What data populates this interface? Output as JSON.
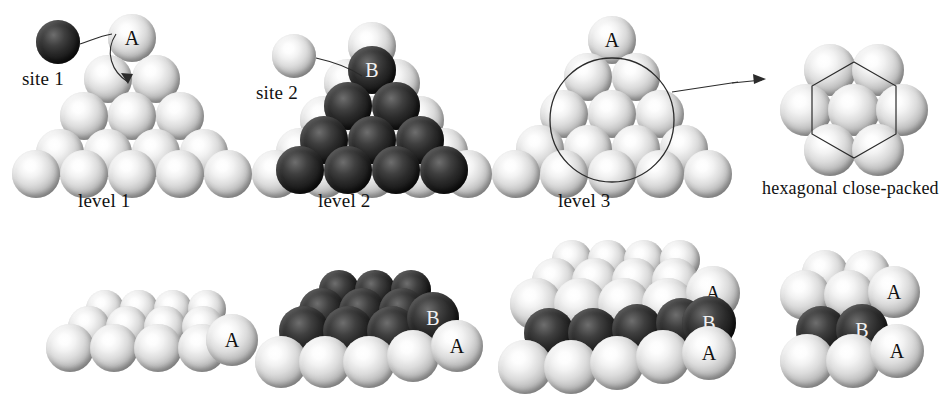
{
  "figure": {
    "type": "crystal-packing-diagram",
    "background": "#ffffff",
    "colors": {
      "light_sphere": "#d8d8d8",
      "dark_sphere": "#1b1b1b",
      "line": "#2b2b2b",
      "text": "#111111"
    }
  },
  "top_row": {
    "panel1": {
      "label": "level 1",
      "site_label": "site 1",
      "site_sphere_shade": "dark",
      "apex_sphere_label": "A",
      "rows": [
        1,
        2,
        3,
        4,
        5
      ],
      "layer_shade": "light"
    },
    "panel2": {
      "label": "level 2",
      "site_label": "site 2",
      "site_sphere_shade": "light",
      "apex_sphere_label": "B",
      "hidden_label": "A",
      "base_rows": [
        1,
        2,
        3,
        4,
        5
      ],
      "top_rows": [
        1,
        2,
        3,
        4
      ],
      "base_shade": "light",
      "top_shade": "dark"
    },
    "panel3": {
      "label": "level 3",
      "apex_sphere_label": "A",
      "rows": [
        1,
        2,
        3,
        4,
        5
      ],
      "layer_shade": "light",
      "highlight": "circle"
    },
    "inset": {
      "caption": "hexagonal close-packed",
      "sphere_count": 7,
      "outline": "hexagon",
      "shade": "light"
    }
  },
  "bottom_row": {
    "panel1": {
      "labels": [
        "A"
      ],
      "layers": 1,
      "shades": [
        "light"
      ]
    },
    "panel2": {
      "labels": [
        "B",
        "A"
      ],
      "layers": 2,
      "shades": [
        "dark",
        "light"
      ]
    },
    "panel3": {
      "labels": [
        "A",
        "B",
        "A"
      ],
      "layers": 3,
      "shades": [
        "light",
        "dark",
        "light"
      ]
    },
    "panel4": {
      "labels": [
        "A",
        "B",
        "A"
      ],
      "layers": 3,
      "shades": [
        "light",
        "dark",
        "light"
      ]
    }
  }
}
